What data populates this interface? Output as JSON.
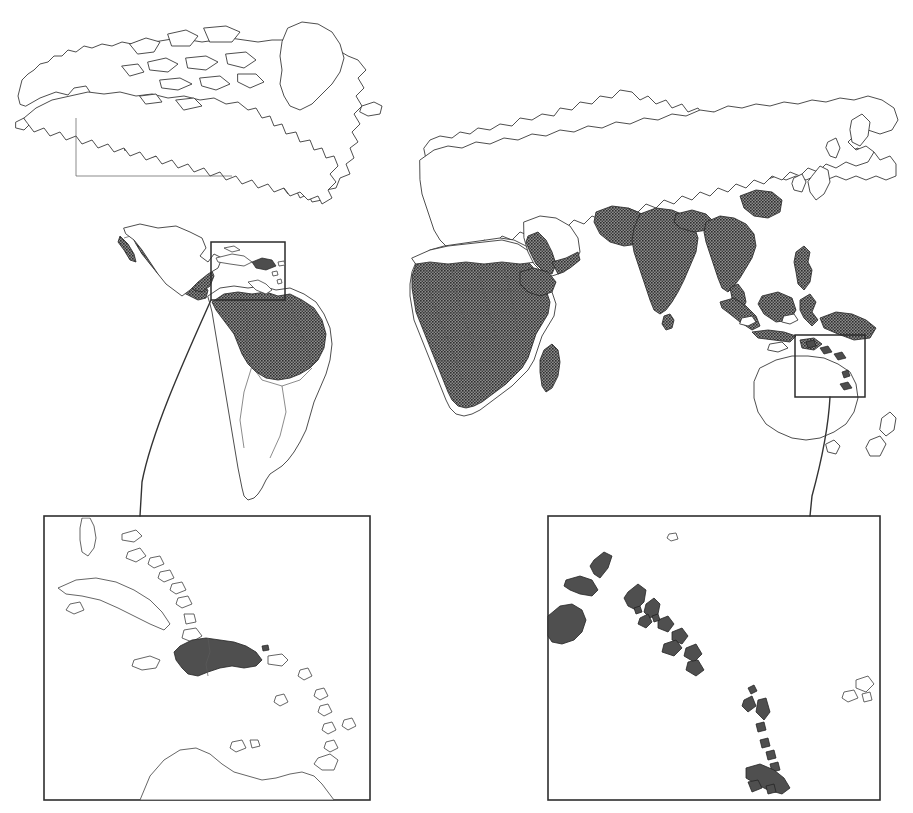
{
  "figure": {
    "type": "world-distribution-map",
    "title": "",
    "caption": "",
    "projection": "equirectangular",
    "background_color": "#ffffff",
    "endemic_fill_color": "#555555",
    "coastline_color": "#3a3a3a",
    "border_color": "#5a5a5a",
    "has_text_labels": false,
    "has_legend": false,
    "has_scale_bar": false,
    "has_graticule": false
  },
  "main_map": {
    "name": "world-map",
    "panels": [
      {
        "name": "americas-panel",
        "region": "Americas",
        "x": 0,
        "y": 0,
        "width": 420,
        "height": 512
      },
      {
        "name": "afro-eurasia-panel",
        "region": "Africa, Eurasia, Australasia",
        "x": 400,
        "y": 0,
        "width": 513,
        "height": 512
      }
    ],
    "shaded_regions": [
      "Southern Mexico",
      "Central America",
      "Northern South America / Amazon Basin",
      "Sub-Saharan Africa",
      "Madagascar",
      "Arabian Peninsula (southwest)",
      "Yemen",
      "Horn of Africa",
      "Iran (southeast)",
      "Pakistan",
      "India",
      "Sri Lanka",
      "Nepal",
      "Bangladesh",
      "Myanmar",
      "Thailand",
      "Laos",
      "Cambodia",
      "Vietnam",
      "Southern China",
      "Malaysia",
      "Indonesia",
      "Philippines",
      "Papua New Guinea",
      "Timor"
    ],
    "unshaded_regions": [
      "Canada",
      "United States",
      "Greenland",
      "Iceland",
      "Europe",
      "North Africa",
      "Russia",
      "Mongolia",
      "Japan",
      "Korea",
      "Australia",
      "New Zealand",
      "Southern South America",
      "Southern Africa"
    ]
  },
  "callouts": [
    {
      "name": "caribbean-callout-box",
      "label": "Caribbean",
      "x": 211,
      "y": 242,
      "width": 74,
      "height": 58,
      "linked_inset": "caribbean-inset"
    },
    {
      "name": "melanesia-callout-box",
      "label": "Melanesia / South Pacific",
      "x": 795,
      "y": 335,
      "width": 70,
      "height": 62,
      "linked_inset": "melanesia-inset"
    }
  ],
  "insets": [
    {
      "name": "caribbean-inset",
      "label": "Caribbean",
      "x": 44,
      "y": 516,
      "width": 326,
      "height": 284,
      "shaded_islands": [
        "Hispaniola (Haiti and Dominican Republic)"
      ],
      "unshaded_islands": [
        "Bahamas",
        "Cuba",
        "Jamaica",
        "Puerto Rico",
        "Lesser Antilles",
        "Trinidad",
        "Northern South America coast"
      ]
    },
    {
      "name": "melanesia-inset",
      "label": "Melanesia / South Pacific",
      "x": 548,
      "y": 516,
      "width": 332,
      "height": 284,
      "shaded_islands": [
        "Papua New Guinea (eastern)",
        "New Britain",
        "New Ireland",
        "Bougainville",
        "Solomon Islands",
        "Santa Cruz Islands",
        "Vanuatu"
      ],
      "unshaded_islands": [
        "Fiji",
        "Nauru"
      ]
    }
  ],
  "legend_note": ""
}
